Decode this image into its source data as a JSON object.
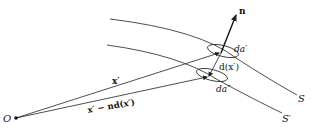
{
  "diagram": {
    "type": "geometry",
    "labels": {
      "origin": "O",
      "normal": "n",
      "area_upper": "da′",
      "area_lower": "da″",
      "displacement": "d(x′)",
      "vector_upper": "x′",
      "vector_lower": "x′ − nd(x′)",
      "surface_upper": "S",
      "surface_lower": "S′"
    },
    "colors": {
      "stroke": "#222222",
      "background": "#ffffff"
    }
  }
}
